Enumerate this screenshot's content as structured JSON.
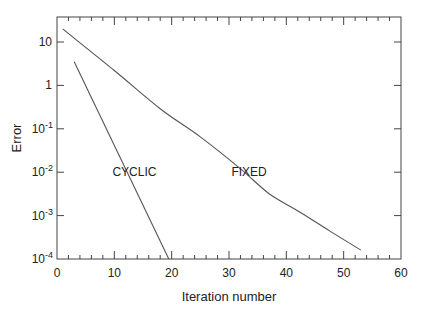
{
  "chart_data": {
    "type": "line",
    "title": "",
    "xlabel": "Iteration number",
    "ylabel": "Error",
    "xlim": [
      0,
      60
    ],
    "ylim": [
      0.0001,
      40
    ],
    "yscale": "log",
    "grid": false,
    "legend": "none (inline labels)",
    "x_ticks": [
      0,
      10,
      20,
      30,
      40,
      50,
      60
    ],
    "x_minor_step": 2,
    "y_ticks": [
      {
        "value": 10,
        "label": "10"
      },
      {
        "value": 1,
        "label": "1"
      },
      {
        "value": 0.1,
        "label": "10",
        "exp": "-1"
      },
      {
        "value": 0.01,
        "label": "10",
        "exp": "-2"
      },
      {
        "value": 0.001,
        "label": "10",
        "exp": "-3"
      },
      {
        "value": 0.0001,
        "label": "10",
        "exp": "-4"
      }
    ],
    "series": [
      {
        "name": "CYCLIC",
        "x": [
          3,
          19.5
        ],
        "values": [
          3.5,
          0.0001
        ],
        "label_pos": [
          13.5,
          0.01
        ]
      },
      {
        "name": "FIXED",
        "x": [
          1,
          10,
          18,
          25,
          32,
          37,
          42.4,
          47.6,
          53
        ],
        "values": [
          20,
          2.2,
          0.29,
          0.065,
          0.012,
          0.0032,
          0.0012,
          0.00044,
          0.00016
        ],
        "label_pos": [
          33.5,
          0.01
        ]
      }
    ],
    "annotations": [
      "CYCLIC",
      "FIXED"
    ]
  }
}
